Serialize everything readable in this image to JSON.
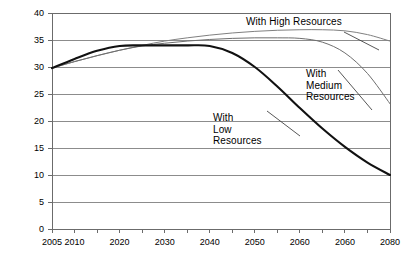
{
  "chart_data": {
    "type": "line",
    "title": "",
    "xlabel": "",
    "ylabel": "Production (billions of bbls)",
    "xlim": [
      2005,
      2080
    ],
    "ylim": [
      0,
      40
    ],
    "grid": true,
    "legend_position": "inline-annotations",
    "x_ticks_labeled": [
      "2005",
      "2010",
      "2020",
      "2030",
      "2040",
      "2050",
      "2060",
      "2060",
      "2080"
    ],
    "x_tick_values": [
      2005,
      2010,
      2020,
      2030,
      2040,
      2050,
      2060,
      2070,
      2080
    ],
    "x_minor_tick_values": [
      2005,
      2010,
      2015,
      2020,
      2025,
      2030,
      2035,
      2040,
      2045,
      2050,
      2055,
      2060,
      2065,
      2070,
      2075,
      2080
    ],
    "y_ticks": [
      0,
      5,
      10,
      15,
      20,
      25,
      30,
      35,
      40
    ],
    "series": [
      {
        "name": "With High Resources",
        "color": "#808080",
        "width": 1.0,
        "x": [
          2005,
          2010,
          2015,
          2020,
          2025,
          2030,
          2035,
          2040,
          2045,
          2050,
          2055,
          2060,
          2065,
          2070,
          2075,
          2080
        ],
        "values": [
          29.8,
          31.0,
          32.1,
          33.1,
          34.0,
          34.8,
          35.4,
          35.9,
          36.3,
          36.6,
          36.8,
          36.9,
          36.9,
          36.7,
          36.0,
          34.8
        ]
      },
      {
        "name": "With Medium Resources",
        "color": "#6e6e6e",
        "width": 1.0,
        "x": [
          2005,
          2010,
          2015,
          2020,
          2025,
          2030,
          2035,
          2040,
          2045,
          2050,
          2055,
          2060,
          2065,
          2070,
          2075,
          2080
        ],
        "values": [
          29.8,
          31.0,
          32.1,
          33.1,
          33.9,
          34.4,
          34.8,
          35.1,
          35.3,
          35.4,
          35.4,
          35.3,
          34.6,
          32.6,
          28.8,
          23.2
        ]
      },
      {
        "name": "With Low Resources",
        "color": "#111111",
        "width": 2.1,
        "x": [
          2005,
          2010,
          2015,
          2020,
          2025,
          2030,
          2035,
          2040,
          2045,
          2050,
          2055,
          2060,
          2065,
          2070,
          2075,
          2080
        ],
        "values": [
          29.8,
          31.5,
          33.0,
          33.9,
          34.0,
          34.0,
          34.0,
          33.9,
          32.6,
          30.0,
          26.4,
          22.4,
          18.6,
          15.2,
          12.3,
          10.0
        ]
      }
    ],
    "annotations": [
      {
        "id": "high",
        "text": "With High Resources",
        "x_px": 246,
        "y_px": 16,
        "leader": {
          "x1": 344,
          "y1": 32,
          "x2": 379,
          "y2": 50
        }
      },
      {
        "id": "medium",
        "text": "With\nMedium\nResources",
        "x_px": 306,
        "y_px": 68,
        "leader": {
          "x1": 338,
          "y1": 70,
          "x2": 372,
          "y2": 110
        }
      },
      {
        "id": "low",
        "text": "With\nLow\nResources",
        "x_px": 213,
        "y_px": 112,
        "leader": {
          "x1": 267,
          "y1": 111,
          "x2": 300,
          "y2": 136
        }
      }
    ]
  },
  "plot_geometry": {
    "left": 52,
    "right": 390,
    "top": 13,
    "bottom": 229
  },
  "colors": {
    "background": "#ffffff",
    "gridline": "#8c8c8c",
    "axis": "#6b6b6b",
    "text": "#000000"
  }
}
